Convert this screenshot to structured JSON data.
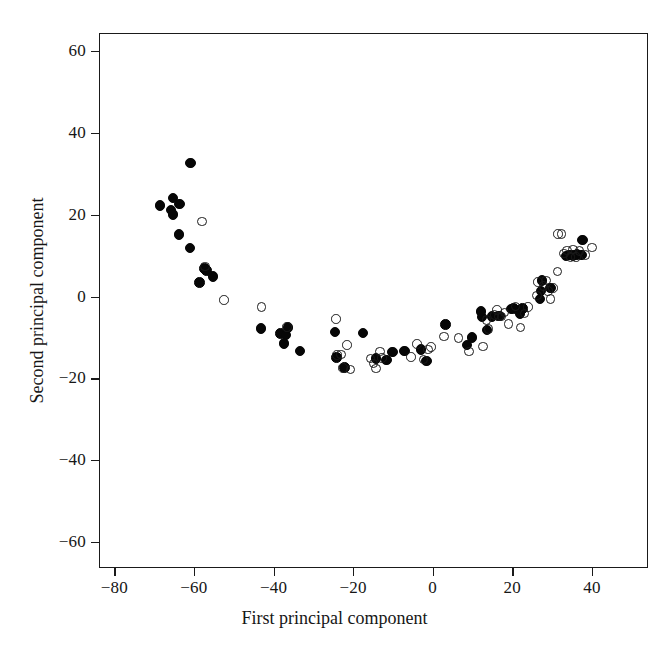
{
  "chart_data": {
    "type": "scatter",
    "title": "",
    "xlabel": "First principal component",
    "ylabel": "Second principal component",
    "xlim": [
      -87,
      51
    ],
    "ylim": [
      -71,
      64
    ],
    "xticks": [
      -80,
      -60,
      -40,
      -20,
      0,
      20,
      40
    ],
    "yticks": [
      -60,
      -40,
      -20,
      0,
      20,
      40,
      60
    ],
    "xticklabels": [
      "−80",
      "−60",
      "−40",
      "−20",
      "0",
      "20",
      "40"
    ],
    "yticklabels": [
      "−60",
      "−40",
      "−20",
      "0",
      "20",
      "40",
      "60"
    ],
    "grid": false,
    "legend": null,
    "frame": "box",
    "series": [
      {
        "name": "filled",
        "marker": "filled-circle",
        "color": "#060606",
        "points": [
          [
            -60.8,
            32.6
          ],
          [
            -68.5,
            22.2
          ],
          [
            -65.3,
            24.1
          ],
          [
            -63.6,
            22.6
          ],
          [
            -65.8,
            21.1
          ],
          [
            -65.2,
            20.1
          ],
          [
            -63.7,
            15.1
          ],
          [
            -61.0,
            11.9
          ],
          [
            -57.3,
            6.9
          ],
          [
            -56.8,
            6.3
          ],
          [
            -55.2,
            4.9
          ],
          [
            -58.6,
            3.4
          ],
          [
            -43.2,
            -7.8
          ],
          [
            -38.2,
            -9.0
          ],
          [
            -36.9,
            -9.4
          ],
          [
            -36.3,
            -7.6
          ],
          [
            -37.3,
            -11.5
          ],
          [
            -33.3,
            -13.3
          ],
          [
            -24.5,
            -8.7
          ],
          [
            -24.2,
            -14.9
          ],
          [
            -22.2,
            -17.3
          ],
          [
            -17.5,
            -8.9
          ],
          [
            -14.3,
            -15.2
          ],
          [
            -11.6,
            -15.5
          ],
          [
            -10.1,
            -13.6
          ],
          [
            -7.1,
            -13.3
          ],
          [
            -2.9,
            -13.0
          ],
          [
            -1.5,
            -15.8
          ],
          [
            3.2,
            -6.9
          ],
          [
            8.6,
            -11.9
          ],
          [
            9.9,
            -10.0
          ],
          [
            12.4,
            -5.0
          ],
          [
            12.1,
            -3.7
          ],
          [
            13.6,
            -8.2
          ],
          [
            14.9,
            -4.9
          ],
          [
            16.4,
            -4.8
          ],
          [
            16.9,
            -4.8
          ],
          [
            19.7,
            -3.0
          ],
          [
            20.3,
            -2.9
          ],
          [
            21.9,
            -4.3
          ],
          [
            22.6,
            -2.9
          ],
          [
            26.9,
            -0.6
          ],
          [
            27.2,
            1.4
          ],
          [
            27.5,
            3.9
          ],
          [
            29.6,
            2.1
          ],
          [
            33.5,
            9.9
          ],
          [
            34.4,
            10.2
          ],
          [
            35.3,
            10.0
          ],
          [
            36.3,
            10.3
          ],
          [
            37.6,
            13.8
          ],
          [
            37.4,
            10.1
          ]
        ]
      },
      {
        "name": "open",
        "marker": "open-circle",
        "color": "#1a1a1a",
        "points": [
          [
            -58.0,
            18.3
          ],
          [
            -57.2,
            7.3
          ],
          [
            -52.4,
            -0.9
          ],
          [
            -43.0,
            -2.6
          ],
          [
            -36.6,
            -7.5
          ],
          [
            -24.3,
            -5.5
          ],
          [
            -24.0,
            -14.3
          ],
          [
            -23.0,
            -14.2
          ],
          [
            -21.5,
            -11.9
          ],
          [
            -22.5,
            -17.5
          ],
          [
            -20.6,
            -17.8
          ],
          [
            -15.6,
            -15.1
          ],
          [
            -14.9,
            -16.4
          ],
          [
            -14.2,
            -17.6
          ],
          [
            -13.2,
            -13.4
          ],
          [
            -12.7,
            -15.0
          ],
          [
            -5.4,
            -14.8
          ],
          [
            -4.0,
            -11.6
          ],
          [
            -2.3,
            -15.4
          ],
          [
            -1.2,
            -12.9
          ],
          [
            2.8,
            -9.8
          ],
          [
            9.1,
            -13.4
          ],
          [
            12.6,
            -12.2
          ],
          [
            13.5,
            -5.8
          ],
          [
            14.0,
            -7.9
          ],
          [
            15.5,
            -4.5
          ],
          [
            16.1,
            -3.3
          ],
          [
            16.6,
            -4.9
          ],
          [
            17.3,
            -4.9
          ],
          [
            18.0,
            -3.9
          ],
          [
            19.0,
            -6.7
          ],
          [
            20.8,
            -2.4
          ],
          [
            22.0,
            -7.6
          ],
          [
            23.1,
            -4.2
          ],
          [
            24.0,
            -2.6
          ],
          [
            26.2,
            0.2
          ],
          [
            26.5,
            3.6
          ],
          [
            27.8,
            2.6
          ],
          [
            28.5,
            3.9
          ],
          [
            29.0,
            1.3
          ],
          [
            29.6,
            -0.6
          ],
          [
            30.2,
            2.1
          ],
          [
            31.4,
            6.1
          ],
          [
            31.5,
            15.3
          ],
          [
            32.4,
            15.3
          ],
          [
            33.0,
            10.5
          ],
          [
            33.8,
            11.2
          ],
          [
            34.6,
            9.6
          ],
          [
            35.2,
            11.5
          ],
          [
            36.0,
            9.7
          ],
          [
            36.9,
            11.1
          ],
          [
            38.4,
            10.2
          ],
          [
            40.0,
            12.0
          ],
          [
            -0.4,
            -12.4
          ],
          [
            6.5,
            -10.1
          ]
        ]
      }
    ]
  },
  "figure": {
    "background": "#ffffff",
    "axis_color": "#1a1a1a",
    "filled_marker_color": "#060606",
    "open_marker_color": "#1a1a1a"
  }
}
